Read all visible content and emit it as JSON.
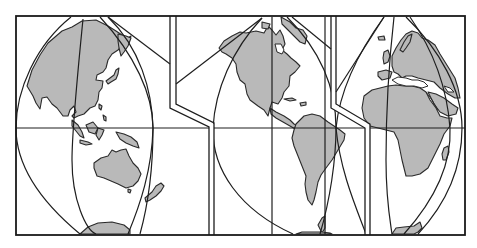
{
  "map": {
    "title": "Interrupted world map projection (three lobes)",
    "projection_type": "interrupted",
    "colors": {
      "land": "#b9b9b9",
      "ocean": "#ffffff",
      "outline": "#1e1e1e"
    },
    "lobes": [
      {
        "name": "asia-australia-lobe",
        "regions": [
          "Asia",
          "Japan",
          "Indonesia",
          "New Guinea",
          "Australia",
          "New Zealand",
          "Antarctica"
        ]
      },
      {
        "name": "americas-lobe",
        "regions": [
          "North America",
          "Greenland",
          "Central America",
          "Caribbean",
          "South America",
          "Antarctica"
        ]
      },
      {
        "name": "europe-africa-lobe",
        "regions": [
          "Europe",
          "British Isles",
          "Iceland",
          "Mediterranean",
          "Africa",
          "Arabian Peninsula",
          "Madagascar",
          "Antarctica"
        ]
      }
    ],
    "graticule": {
      "equator": true,
      "central_meridians": 3
    }
  }
}
